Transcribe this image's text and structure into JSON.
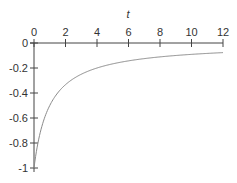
{
  "chart_data": {
    "type": "line",
    "title": "",
    "xlabel": "t",
    "ylabel": "",
    "xlim": [
      0,
      12
    ],
    "ylim": [
      -1,
      0
    ],
    "grid": false,
    "x_axis_position": "top (at y=0)",
    "x_ticks": [
      0,
      2,
      4,
      6,
      8,
      10,
      12
    ],
    "x_tick_labels": [
      "0",
      "2",
      "4",
      "6",
      "8",
      "10",
      "12"
    ],
    "y_ticks": [
      0,
      -0.2,
      -0.4,
      -0.6,
      -0.8,
      -1
    ],
    "y_tick_labels": [
      "0",
      "-0.2",
      "-0.4",
      "-0.6",
      "-0.8",
      "-1"
    ],
    "series": [
      {
        "name": "y(t)",
        "color": "#8a8a8a",
        "x": [
          0,
          0.25,
          0.5,
          1,
          1.5,
          2,
          3,
          4,
          5,
          6,
          7,
          8,
          9,
          10,
          11,
          12
        ],
        "values": [
          -1,
          -0.8,
          -0.667,
          -0.5,
          -0.4,
          -0.333,
          -0.25,
          -0.2,
          -0.167,
          -0.143,
          -0.125,
          -0.111,
          -0.1,
          -0.091,
          -0.083,
          -0.077
        ]
      }
    ]
  }
}
